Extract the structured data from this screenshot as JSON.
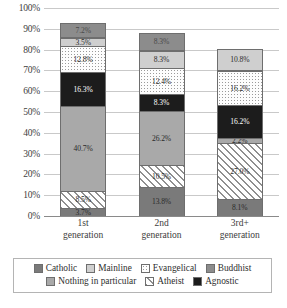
{
  "chart_data": {
    "type": "bar",
    "subtype": "stacked-percent",
    "title": "",
    "xlabel": "",
    "ylabel": "",
    "ylim": [
      0,
      100
    ],
    "yticks": [
      "0%",
      "10%",
      "20%",
      "30%",
      "40%",
      "50%",
      "60%",
      "70%",
      "80%",
      "90%",
      "100%"
    ],
    "grid": true,
    "legend_position": "bottom",
    "categories": [
      "1st generation",
      "2nd generation",
      "3rd+ generation"
    ],
    "category_lines": [
      [
        "1st",
        "generation"
      ],
      [
        "2nd",
        "generation"
      ],
      [
        "3rd+",
        "generation"
      ]
    ],
    "stack_order": [
      "Catholic",
      "Atheist",
      "Nothing in particular",
      "Agnostic",
      "Evangelical",
      "Mainline",
      "Buddhist"
    ],
    "series": [
      {
        "name": "Catholic",
        "fill": "f-catholic",
        "values": [
          3.7,
          13.8,
          8.1
        ],
        "labels": [
          "3.7%",
          "13.8%",
          "8.1%"
        ]
      },
      {
        "name": "Atheist",
        "fill": "f-atheist",
        "values": [
          8.5,
          10.5,
          27.0
        ],
        "labels": [
          "8.5%",
          "10.5%",
          "27.0%"
        ]
      },
      {
        "name": "Nothing in particular",
        "fill": "f-nothing",
        "values": [
          40.7,
          26.2,
          2.2
        ],
        "labels": [
          "40.7%",
          "26.2%",
          "2.2%"
        ]
      },
      {
        "name": "Agnostic",
        "fill": "f-agnostic",
        "values": [
          16.3,
          8.3,
          16.2
        ],
        "labels": [
          "16.3%",
          "8.3%",
          "16.2%"
        ]
      },
      {
        "name": "Evangelical",
        "fill": "f-evangelical",
        "values": [
          12.8,
          12.4,
          16.2
        ],
        "labels": [
          "12.8%",
          "12.4%",
          "16.2%"
        ]
      },
      {
        "name": "Mainline",
        "fill": "f-mainline",
        "values": [
          3.5,
          8.3,
          10.8
        ],
        "labels": [
          "3.5%",
          "8.3%",
          "10.8%"
        ]
      },
      {
        "name": "Buddhist",
        "fill": "f-buddhist",
        "values": [
          7.2,
          8.3,
          0.0
        ],
        "labels": [
          "7.2%",
          "8.3%",
          ""
        ]
      }
    ],
    "bars": [
      {
        "category": "1st generation",
        "segments": [
          {
            "name": "Catholic",
            "value": 3.7,
            "label": "3.7%",
            "fill": "f-catholic"
          },
          {
            "name": "Atheist",
            "value": 8.5,
            "label": "8.5%",
            "fill": "f-atheist"
          },
          {
            "name": "Nothing in particular",
            "value": 40.7,
            "label": "40.7%",
            "fill": "f-nothing"
          },
          {
            "name": "Agnostic",
            "value": 16.3,
            "label": "16.3%",
            "fill": "f-agnostic"
          },
          {
            "name": "Evangelical",
            "value": 12.8,
            "label": "12.8%",
            "fill": "f-evangelical"
          },
          {
            "name": "Mainline",
            "value": 3.5,
            "label": "3.5%",
            "fill": "f-mainline"
          },
          {
            "name": "Buddhist",
            "value": 7.2,
            "label": "7.2%",
            "fill": "f-buddhist"
          }
        ]
      },
      {
        "category": "2nd generation",
        "segments": [
          {
            "name": "Catholic",
            "value": 13.8,
            "label": "13.8%",
            "fill": "f-catholic"
          },
          {
            "name": "Atheist",
            "value": 10.5,
            "label": "10.5%",
            "fill": "f-atheist"
          },
          {
            "name": "Nothing in particular",
            "value": 26.2,
            "label": "26.2%",
            "fill": "f-nothing"
          },
          {
            "name": "Agnostic",
            "value": 8.3,
            "label": "8.3%",
            "fill": "f-agnostic"
          },
          {
            "name": "Evangelical",
            "value": 12.4,
            "label": "12.4%",
            "fill": "f-evangelical"
          },
          {
            "name": "Mainline",
            "value": 8.3,
            "label": "8.3%",
            "fill": "f-mainline"
          },
          {
            "name": "Buddhist",
            "value": 8.3,
            "label": "8.3%",
            "fill": "f-buddhist"
          }
        ]
      },
      {
        "category": "3rd+ generation",
        "segments": [
          {
            "name": "Catholic",
            "value": 8.1,
            "label": "8.1%",
            "fill": "f-catholic"
          },
          {
            "name": "Atheist",
            "value": 27.0,
            "label": "27.0%",
            "fill": "f-atheist"
          },
          {
            "name": "Nothing in particular",
            "value": 2.2,
            "label": "2.2%",
            "fill": "f-nothing"
          },
          {
            "name": "Agnostic",
            "value": 16.2,
            "label": "16.2%",
            "fill": "f-agnostic"
          },
          {
            "name": "Evangelical",
            "value": 16.2,
            "label": "16.2%",
            "fill": "f-evangelical"
          },
          {
            "name": "Mainline",
            "value": 10.8,
            "label": "10.8%",
            "fill": "f-mainline"
          }
        ]
      }
    ],
    "legend": [
      {
        "name": "Catholic",
        "label": "Catholic",
        "fill": "f-catholic"
      },
      {
        "name": "Mainline",
        "label": "Mainline",
        "fill": "f-mainline"
      },
      {
        "name": "Evangelical",
        "label": "Evangelical",
        "fill": "f-evangelical"
      },
      {
        "name": "Buddhist",
        "label": "Buddhist",
        "fill": "f-buddhist"
      },
      {
        "name": "Nothing in particular",
        "label": "Nothing in particular",
        "fill": "f-nothing"
      },
      {
        "name": "Atheist",
        "label": "Atheist",
        "fill": "f-atheist"
      },
      {
        "name": "Agnostic",
        "label": "Agnostic",
        "fill": "f-agnostic"
      }
    ],
    "legend_rows": [
      4,
      3
    ]
  }
}
